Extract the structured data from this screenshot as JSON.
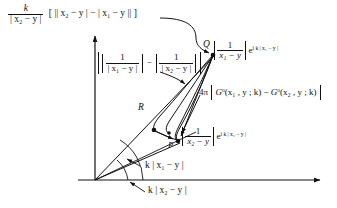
{
  "figure": {
    "kind": "phasor-geometry-diagram",
    "ink_color": "#111111",
    "background": "#ffffff"
  },
  "top_formula": {
    "coefficient_numerator": "k",
    "coefficient_denominator": "| x₂ − y |",
    "bracket_expression": "[ || x₂ − y | − | x₁ − y || ]",
    "plain": "k / |x₂−y| [ ||x₂−y| − |x₁−y|| ]"
  },
  "amplitude_difference": {
    "plain": "| 1/|x₁−y| − 1/|x₂−y| |",
    "term1_num": "1",
    "term1_den": "| x₁ − y |",
    "minus": "−",
    "term2_num": "1",
    "term2_den": "| x₂ − y |"
  },
  "label_Q": {
    "point": "Q",
    "expression": "| 1/(x₁ − y) | e^{ i k | x₁ − y | }",
    "frac_num": "1",
    "frac_den": "x₁ − y",
    "exp_base": "e",
    "exp_power": "i k | x₁ − y |"
  },
  "label_P": {
    "point": "P",
    "expression": "| 1/(x₂ − y) | e^{ i k | x₂ − y | }",
    "frac_num": "1",
    "frac_den": "x₂ − y",
    "exp_base": "e",
    "exp_power": "i k | x₂ − y |"
  },
  "label_R": {
    "point": "R"
  },
  "greens_difference": {
    "prefactor": "4π",
    "expression": "4π | Gᵒ(x₁, y; k) − Gᵒ(x₂, y; k) |",
    "g1": "G",
    "g1_args": "(x₁ , y ; k)",
    "minus": "−",
    "g2": "G",
    "g2_args": "(x₂ , y ; k)",
    "superscript": "o"
  },
  "angles": [
    {
      "id": "angle-upper",
      "label": "k | x₁ − y |",
      "degrees": 58
    },
    {
      "id": "angle-lower",
      "label": "k | x₂ − y |",
      "degrees": 47
    }
  ],
  "axes": {
    "vertical": {
      "name": "imaginary-axis",
      "has_arrow": true
    },
    "horizontal": {
      "name": "real-axis",
      "has_arrow": true
    },
    "origin": {
      "x": 95,
      "y": 180
    }
  },
  "points": [
    {
      "name": "Q",
      "x": 213,
      "y": 55
    },
    {
      "name": "R",
      "x": 152,
      "y": 112
    },
    {
      "name": "P",
      "x": 178,
      "y": 141
    }
  ]
}
